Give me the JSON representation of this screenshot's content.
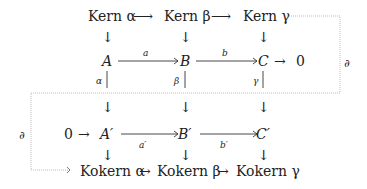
{
  "diagram": {
    "rows": {
      "kernels": [
        "Kern α",
        "Kern β",
        "Kern γ"
      ],
      "top": [
        "A",
        "B",
        "C",
        "0"
      ],
      "bottom": [
        "0",
        "A′",
        "B′",
        "C′"
      ],
      "cokernels": [
        "Kokern α",
        "Kokern β",
        "Kokern γ"
      ]
    },
    "labels": {
      "a": "a",
      "b": "b",
      "a_prime": "a′",
      "b_prime": "b′",
      "alpha": "α",
      "beta": "β",
      "gamma": "γ",
      "delta_right": "∂",
      "delta_left": "∂"
    },
    "arrows": {
      "right": "⟶",
      "short_right": "→",
      "down": "↓"
    }
  }
}
